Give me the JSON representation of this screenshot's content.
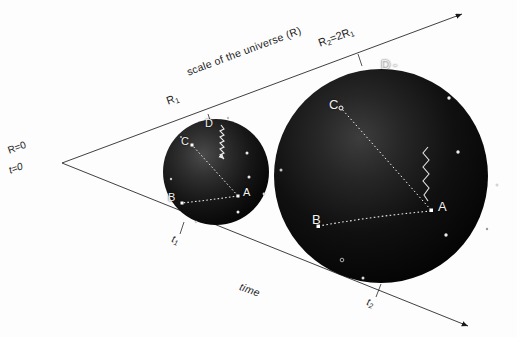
{
  "figure": {
    "title_alt": "Expanding universe diagram: two spheres at times t1 and t2",
    "background_color": "#fdfdfd",
    "ink_color": "#1a1a1a",
    "sphere_color": "#050505",
    "marker_color": "#f2f2f2"
  },
  "axes": {
    "upper_label": "scale of the universe (R)",
    "lower_label": "time",
    "origin_scale": "R=0",
    "origin_time": "t=0",
    "origin_point": {
      "x": 62,
      "y": 163
    },
    "upper_arrow_end": {
      "x": 462,
      "y": 14
    },
    "lower_arrow_end": {
      "x": 468,
      "y": 326
    }
  },
  "radii": {
    "r1_label": "R",
    "r1_sub": "1",
    "r2_label": "R",
    "r2_sub": "2",
    "r2_equals": "=2R",
    "r2_sub2": "1"
  },
  "ticks": [
    {
      "label": "t",
      "sub": "1",
      "x": 177,
      "y": 239
    },
    {
      "label": "t",
      "sub": "2",
      "x": 372,
      "y": 302
    }
  ],
  "spheres": [
    {
      "name": "sphere-t1",
      "cx": 216,
      "cy": 172,
      "r": 53,
      "radius_label": "R1",
      "time_label": "t1",
      "points": [
        {
          "id": "A",
          "x": 238,
          "y": 196,
          "label_dx": 5,
          "label_dy": -4
        },
        {
          "id": "B",
          "x": 182,
          "y": 202,
          "label_dx": -12,
          "label_dy": -6
        },
        {
          "id": "C",
          "x": 192,
          "y": 145,
          "label_dx": -11,
          "label_dy": -3
        },
        {
          "id": "D",
          "x": 215,
          "y": 127,
          "label_dx": -10,
          "label_dy": -2
        }
      ],
      "stars": [
        {
          "x": 247,
          "y": 153
        },
        {
          "x": 249,
          "y": 177
        },
        {
          "x": 264,
          "y": 194
        },
        {
          "x": 238,
          "y": 212
        },
        {
          "x": 171,
          "y": 179
        },
        {
          "x": 196,
          "y": 222
        },
        {
          "x": 228,
          "y": 118
        },
        {
          "x": 181,
          "y": 137
        }
      ],
      "connections": [
        {
          "from": "A",
          "to": "C",
          "style": "dotted"
        },
        {
          "from": "A",
          "to": "B",
          "style": "dotted"
        }
      ],
      "wave": {
        "from": "D",
        "to": "A",
        "style": "squiggle-arrow"
      }
    },
    {
      "name": "sphere-t2",
      "cx": 381,
      "cy": 176,
      "r": 107,
      "radius_label": "R2",
      "time_label": "t2",
      "points": [
        {
          "id": "A",
          "x": 431,
          "y": 210,
          "label_dx": 7,
          "label_dy": -5
        },
        {
          "id": "B",
          "x": 318,
          "y": 225,
          "label_dx": -14,
          "label_dy": -7
        },
        {
          "id": "C",
          "x": 341,
          "y": 108,
          "label_dx": -13,
          "label_dy": -4
        },
        {
          "id": "D",
          "x": 391,
          "y": 68,
          "label_dx": -12,
          "label_dy": -3
        }
      ],
      "stars": [
        {
          "x": 449,
          "y": 98
        },
        {
          "x": 458,
          "y": 152
        },
        {
          "x": 497,
          "y": 185
        },
        {
          "x": 446,
          "y": 235
        },
        {
          "x": 281,
          "y": 170
        },
        {
          "x": 342,
          "y": 260
        },
        {
          "x": 363,
          "y": 278
        },
        {
          "x": 300,
          "y": 230
        }
      ],
      "connections": [
        {
          "from": "A",
          "to": "C",
          "style": "dotted"
        },
        {
          "from": "A",
          "to": "B",
          "style": "dotted"
        }
      ],
      "wave": {
        "from": "top",
        "to": "A",
        "style": "squiggle"
      }
    }
  ]
}
